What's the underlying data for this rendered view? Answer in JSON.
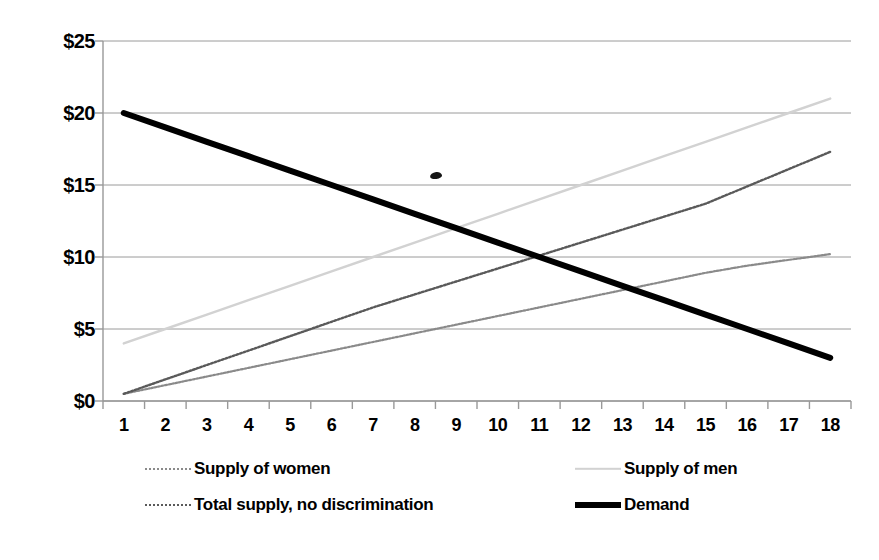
{
  "chart_data": {
    "type": "line",
    "title": "",
    "xlabel": "",
    "ylabel": "",
    "categories": [
      "1",
      "2",
      "3",
      "4",
      "5",
      "6",
      "7",
      "8",
      "9",
      "10",
      "11",
      "12",
      "13",
      "14",
      "15",
      "16",
      "17",
      "18"
    ],
    "x": [
      1,
      2,
      3,
      4,
      5,
      6,
      7,
      8,
      9,
      10,
      11,
      12,
      13,
      14,
      15,
      16,
      17,
      18
    ],
    "ylim": [
      0,
      25
    ],
    "ytick_values": [
      0,
      5,
      10,
      15,
      20,
      25
    ],
    "ytick_labels": [
      "$0",
      "$5",
      "$10",
      "$15",
      "$20",
      "$25"
    ],
    "xtick_labels": [
      "1",
      "2",
      "3",
      "4",
      "5",
      "6",
      "7",
      "8",
      "9",
      "10",
      "11",
      "12",
      "13",
      "14",
      "15",
      "16",
      "17",
      "18"
    ],
    "grid": "horizontal",
    "legend_position": "bottom",
    "series": [
      {
        "name": "Supply of women",
        "values": [
          0.5,
          1.1,
          1.7,
          2.3,
          2.9,
          3.5,
          4.1,
          4.7,
          5.3,
          5.9,
          6.5,
          7.1,
          7.7,
          8.3,
          8.9,
          9.4,
          9.8,
          10.2
        ],
        "color": "#8a8a8a",
        "style": "dotted",
        "width": 2.2
      },
      {
        "name": "Supply of men",
        "values": [
          4.0,
          5.0,
          6.0,
          7.0,
          8.0,
          9.0,
          10.0,
          11.0,
          12.0,
          13.0,
          14.0,
          15.0,
          16.0,
          17.0,
          18.0,
          19.0,
          20.0,
          21.0
        ],
        "color": "#d2d2d2",
        "style": "solid",
        "width": 2.4
      },
      {
        "name": "Total supply, no discrimination",
        "values": [
          0.5,
          1.5,
          2.5,
          3.5,
          4.5,
          5.5,
          6.5,
          7.4,
          8.3,
          9.2,
          10.1,
          11.0,
          11.9,
          12.8,
          13.7,
          14.9,
          16.1,
          17.3
        ],
        "color": "#5a5a5a",
        "style": "dotted",
        "width": 2.4
      },
      {
        "name": "Demand",
        "values": [
          20.0,
          19.0,
          18.0,
          17.0,
          16.0,
          15.0,
          14.0,
          13.0,
          12.0,
          11.0,
          10.0,
          9.0,
          8.0,
          7.0,
          6.0,
          5.0,
          4.0,
          3.0
        ],
        "color": "#000000",
        "style": "solid",
        "width": 6
      }
    ],
    "axis_color": "#999999",
    "gridline_color": "#9a9a9a",
    "background": "#ffffff"
  },
  "legend": {
    "items": [
      {
        "label": "Supply of women"
      },
      {
        "label": "Supply of men"
      },
      {
        "label": "Total supply, no discrimination"
      },
      {
        "label": "Demand"
      }
    ]
  }
}
